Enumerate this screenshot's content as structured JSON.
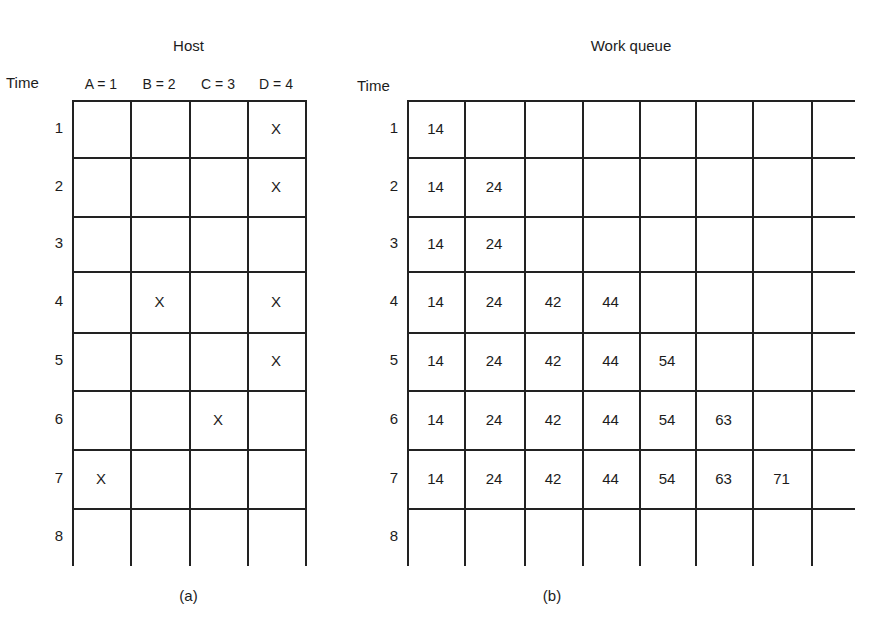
{
  "panel_a": {
    "title": "Host",
    "time_label": "Time",
    "columns": [
      "A = 1",
      "B = 2",
      "C = 3",
      "D = 4"
    ],
    "rows": [
      "1",
      "2",
      "3",
      "4",
      "5",
      "6",
      "7",
      "8"
    ],
    "marks": [
      [
        "",
        "",
        "",
        "X"
      ],
      [
        "",
        "",
        "",
        "X"
      ],
      [
        "",
        "",
        "",
        ""
      ],
      [
        "",
        "X",
        "",
        "X"
      ],
      [
        "",
        "",
        "",
        "X"
      ],
      [
        "",
        "",
        "X",
        ""
      ],
      [
        "X",
        "",
        "",
        ""
      ],
      [
        "",
        "",
        "",
        ""
      ]
    ],
    "caption": "(a)"
  },
  "panel_b": {
    "title": "Work queue",
    "time_label": "Time",
    "rows": [
      "1",
      "2",
      "3",
      "4",
      "5",
      "6",
      "7",
      "8"
    ],
    "cells": [
      [
        "14"
      ],
      [
        "14",
        "24"
      ],
      [
        "14",
        "24"
      ],
      [
        "14",
        "24",
        "42",
        "44"
      ],
      [
        "14",
        "24",
        "42",
        "44",
        "54"
      ],
      [
        "14",
        "24",
        "42",
        "44",
        "54",
        "63"
      ],
      [
        "14",
        "24",
        "42",
        "44",
        "54",
        "63",
        "71"
      ],
      []
    ],
    "caption": "(b)"
  },
  "colors": {
    "ink": "#1c1c1c",
    "background": "#ffffff"
  }
}
